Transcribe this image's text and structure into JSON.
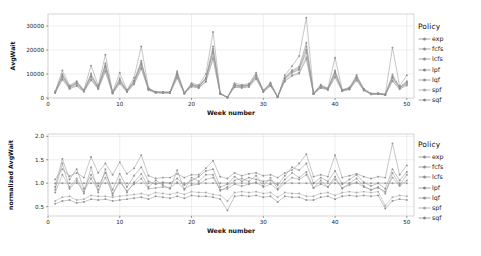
{
  "legend": {
    "title": "Policy",
    "items": [
      {
        "label": "exp",
        "color": "#8d8d8d"
      },
      {
        "label": "fcfs",
        "color": "#8f8f8f"
      },
      {
        "label": "lcfs",
        "color": "#909090"
      },
      {
        "label": "lpf",
        "color": "#8a8a8a"
      },
      {
        "label": "lqf",
        "color": "#939393"
      },
      {
        "label": "spf",
        "color": "#a6a6a6"
      },
      {
        "label": "sqf",
        "color": "#8b8b8b"
      }
    ]
  },
  "chart_data": [
    {
      "type": "line",
      "id": "avgwait",
      "title": "",
      "xlabel": "Week number",
      "ylabel": "AvgWait",
      "xlim": [
        0,
        51
      ],
      "ylim": [
        0,
        35000
      ],
      "xticks": [
        0,
        10,
        20,
        30,
        40,
        50
      ],
      "yticks": [
        0,
        10000,
        20000,
        30000
      ],
      "grid": true,
      "legend_position": "right",
      "x": [
        1,
        2,
        3,
        4,
        5,
        6,
        7,
        8,
        9,
        10,
        11,
        12,
        13,
        14,
        15,
        16,
        17,
        18,
        19,
        20,
        21,
        22,
        23,
        24,
        25,
        26,
        27,
        28,
        29,
        30,
        31,
        32,
        33,
        34,
        35,
        36,
        37,
        38,
        39,
        40,
        41,
        42,
        43,
        44,
        45,
        46,
        47,
        48,
        49,
        50
      ],
      "series": [
        {
          "name": "exp",
          "values": [
            2700,
            11500,
            5200,
            7000,
            3300,
            13500,
            5200,
            18000,
            2500,
            10500,
            3400,
            8500,
            21500,
            4200,
            2600,
            2500,
            2500,
            11200,
            2200,
            6200,
            5400,
            10000,
            27500,
            2000,
            300,
            6200,
            5500,
            6000,
            10500,
            3200,
            6500,
            500,
            9500,
            13200,
            17500,
            33500,
            2000,
            5500,
            4100,
            16800,
            3500,
            4400,
            9600,
            3900,
            1900,
            2000,
            1600,
            21000,
            5000,
            9500
          ]
        },
        {
          "name": "fcfs",
          "values": [
            2600,
            10000,
            4800,
            6600,
            3200,
            10200,
            4600,
            14500,
            2300,
            8200,
            3000,
            7300,
            15500,
            3900,
            2500,
            2400,
            2400,
            10500,
            2100,
            5800,
            5000,
            8500,
            21500,
            1900,
            280,
            5600,
            5100,
            5600,
            9700,
            3000,
            6000,
            480,
            8600,
            11600,
            13000,
            23000,
            1900,
            5100,
            3900,
            11500,
            3300,
            4100,
            8900,
            3700,
            1800,
            1900,
            1500,
            9800,
            4600,
            7000
          ]
        },
        {
          "name": "lcfs",
          "values": [
            2500,
            9500,
            4600,
            6300,
            3100,
            9500,
            4400,
            13800,
            2200,
            7600,
            2900,
            7000,
            14800,
            3800,
            2450,
            2350,
            2350,
            10000,
            2050,
            5600,
            4800,
            8200,
            20500,
            1850,
            270,
            5400,
            4900,
            5400,
            9400,
            2900,
            5800,
            470,
            8300,
            11200,
            12500,
            21500,
            1850,
            4900,
            3800,
            10900,
            3200,
            4000,
            8600,
            3600,
            1750,
            1850,
            1450,
            9000,
            4400,
            6600
          ]
        },
        {
          "name": "lpf",
          "values": [
            2450,
            9000,
            4500,
            6000,
            3000,
            9000,
            4300,
            13200,
            2150,
            7200,
            2850,
            6800,
            14200,
            3700,
            2400,
            2300,
            2300,
            9600,
            2000,
            5400,
            4700,
            7900,
            19500,
            1800,
            265,
            5200,
            4800,
            5300,
            9100,
            2850,
            5700,
            460,
            8000,
            10800,
            12000,
            20000,
            1800,
            4800,
            3750,
            10400,
            3150,
            3950,
            8400,
            3550,
            1720,
            1800,
            1420,
            8500,
            4300,
            6300
          ]
        },
        {
          "name": "lqf",
          "values": [
            2400,
            8700,
            4400,
            5800,
            2950,
            8600,
            4200,
            12800,
            2100,
            7000,
            2800,
            6600,
            13800,
            3650,
            2380,
            2280,
            2280,
            9300,
            1980,
            5300,
            4600,
            7700,
            18800,
            1780,
            260,
            5100,
            4700,
            5200,
            8900,
            2800,
            5600,
            450,
            7850,
            10500,
            11700,
            19000,
            1780,
            4700,
            3700,
            10000,
            3100,
            3900,
            8200,
            3500,
            1700,
            1780,
            1400,
            8200,
            4200,
            6100
          ]
        },
        {
          "name": "spf",
          "values": [
            2200,
            8000,
            4000,
            5200,
            2700,
            7800,
            3900,
            11600,
            1950,
            6300,
            2600,
            6000,
            12800,
            3400,
            2200,
            2100,
            2100,
            8600,
            1850,
            4900,
            4300,
            7000,
            17000,
            1650,
            240,
            4700,
            4400,
            4800,
            8200,
            2600,
            5200,
            420,
            7200,
            9600,
            10600,
            17000,
            1650,
            4300,
            3450,
            9000,
            2900,
            3650,
            7600,
            3250,
            1580,
            1650,
            1300,
            7300,
            3850,
            5500
          ]
        },
        {
          "name": "sqf",
          "values": [
            2100,
            7600,
            3800,
            5000,
            2600,
            7400,
            3750,
            11000,
            1880,
            6000,
            2500,
            5700,
            12200,
            3300,
            2150,
            2050,
            2050,
            8300,
            1800,
            4700,
            4150,
            6700,
            16200,
            1600,
            230,
            4500,
            4200,
            4600,
            7900,
            2500,
            5000,
            410,
            6900,
            9200,
            10200,
            16200,
            1600,
            4150,
            3350,
            8600,
            2800,
            3550,
            7300,
            3150,
            1520,
            1600,
            1250,
            7000,
            3700,
            5250
          ]
        }
      ]
    },
    {
      "type": "line",
      "id": "normalized-avgwait",
      "title": "",
      "xlabel": "Week number",
      "ylabel": "normalized AvgWait",
      "xlim": [
        0,
        51
      ],
      "ylim": [
        0.3,
        2.05
      ],
      "xticks": [
        0,
        10,
        20,
        30,
        40,
        50
      ],
      "yticks": [
        0.5,
        1.0,
        1.5,
        2.0
      ],
      "ytick_labels": [
        "0.5",
        "1.0",
        "1.5",
        "2.0"
      ],
      "grid": true,
      "legend_position": "right",
      "x": [
        1,
        2,
        3,
        4,
        5,
        6,
        7,
        8,
        9,
        10,
        11,
        12,
        13,
        14,
        15,
        16,
        17,
        18,
        19,
        20,
        21,
        22,
        23,
        24,
        25,
        26,
        27,
        28,
        29,
        30,
        31,
        32,
        33,
        34,
        35,
        36,
        37,
        38,
        39,
        40,
        41,
        42,
        43,
        44,
        45,
        46,
        47,
        48,
        49,
        50
      ],
      "series": [
        {
          "name": "exp",
          "values": [
            1.08,
            1.3,
            1.15,
            1.22,
            1.12,
            1.56,
            1.22,
            1.42,
            1.18,
            1.45,
            1.2,
            1.32,
            1.6,
            1.16,
            1.1,
            1.12,
            1.12,
            1.2,
            1.12,
            1.18,
            1.18,
            1.32,
            1.48,
            1.14,
            1.1,
            1.22,
            1.16,
            1.2,
            1.22,
            1.16,
            1.18,
            1.12,
            1.22,
            1.28,
            1.42,
            1.62,
            1.14,
            1.18,
            1.14,
            1.6,
            1.12,
            1.16,
            1.2,
            1.14,
            1.1,
            1.14,
            1.12,
            1.85,
            1.18,
            1.38
          ]
        },
        {
          "name": "fcfs",
          "values": [
            1.0,
            1.0,
            1.0,
            1.0,
            1.0,
            1.0,
            1.0,
            1.0,
            1.0,
            1.0,
            1.0,
            1.0,
            1.0,
            1.0,
            1.0,
            1.0,
            1.0,
            1.0,
            1.0,
            1.0,
            1.0,
            1.0,
            1.0,
            1.0,
            1.0,
            1.0,
            1.0,
            1.0,
            1.0,
            1.0,
            1.0,
            1.0,
            1.0,
            1.0,
            1.0,
            1.0,
            1.0,
            1.0,
            1.0,
            1.0,
            1.0,
            1.0,
            1.0,
            1.0,
            1.0,
            1.0,
            1.0,
            1.0,
            1.0,
            1.0
          ]
        },
        {
          "name": "lcfs",
          "values": [
            0.86,
            1.42,
            0.88,
            1.05,
            0.78,
            1.34,
            0.8,
            1.3,
            0.74,
            1.08,
            0.8,
            1.02,
            1.2,
            0.92,
            1.06,
            0.96,
            0.88,
            1.28,
            0.86,
            1.12,
            1.04,
            1.18,
            1.18,
            0.84,
            0.92,
            1.06,
            1.1,
            1.04,
            1.16,
            0.94,
            1.12,
            0.88,
            1.08,
            1.22,
            1.12,
            1.24,
            0.9,
            1.06,
            0.92,
            1.14,
            0.88,
            1.0,
            1.1,
            0.94,
            0.86,
            0.92,
            0.78,
            1.22,
            0.96,
            1.18
          ]
        },
        {
          "name": "lpf",
          "values": [
            0.92,
            1.52,
            1.08,
            1.3,
            0.88,
            1.18,
            0.94,
            1.22,
            0.86,
            1.2,
            0.92,
            1.16,
            1.34,
            1.04,
            0.98,
            1.02,
            1.0,
            1.1,
            0.96,
            1.06,
            1.14,
            1.26,
            1.3,
            0.92,
            0.98,
            1.14,
            1.04,
            1.12,
            1.08,
            1.04,
            1.06,
            0.96,
            1.16,
            1.34,
            1.28,
            1.42,
            1.0,
            1.12,
            1.04,
            1.26,
            0.98,
            1.08,
            1.18,
            1.02,
            0.94,
            1.0,
            0.88,
            1.3,
            1.06,
            1.24
          ]
        },
        {
          "name": "lqf",
          "values": [
            0.8,
            1.18,
            0.92,
            1.1,
            0.82,
            1.1,
            0.86,
            1.12,
            0.78,
            1.02,
            0.84,
            0.98,
            1.1,
            0.88,
            0.9,
            0.92,
            0.9,
            1.02,
            0.88,
            0.96,
            0.98,
            1.08,
            1.12,
            0.86,
            0.88,
            0.98,
            0.94,
            0.98,
            1.02,
            0.92,
            0.98,
            0.86,
            1.0,
            1.12,
            1.08,
            1.18,
            0.9,
            0.98,
            0.92,
            1.08,
            0.9,
            0.96,
            1.02,
            0.92,
            0.86,
            0.9,
            0.82,
            1.12,
            0.94,
            1.06
          ]
        },
        {
          "name": "spf",
          "values": [
            0.62,
            0.7,
            0.72,
            0.64,
            0.66,
            0.74,
            0.72,
            0.72,
            0.7,
            0.72,
            0.74,
            0.76,
            0.78,
            0.74,
            0.8,
            0.78,
            0.76,
            0.8,
            0.76,
            0.82,
            0.8,
            0.8,
            0.76,
            0.74,
            0.62,
            0.8,
            0.82,
            0.8,
            0.82,
            0.78,
            0.8,
            0.7,
            0.8,
            0.78,
            0.78,
            0.72,
            0.72,
            0.78,
            0.8,
            0.74,
            0.8,
            0.82,
            0.8,
            0.82,
            0.8,
            0.82,
            0.52,
            0.7,
            0.74,
            0.72
          ]
        },
        {
          "name": "sqf",
          "values": [
            0.56,
            0.62,
            0.64,
            0.58,
            0.6,
            0.66,
            0.64,
            0.66,
            0.62,
            0.64,
            0.66,
            0.68,
            0.7,
            0.66,
            0.72,
            0.7,
            0.68,
            0.72,
            0.68,
            0.74,
            0.72,
            0.72,
            0.7,
            0.66,
            0.42,
            0.72,
            0.74,
            0.72,
            0.74,
            0.7,
            0.72,
            0.6,
            0.72,
            0.7,
            0.7,
            0.64,
            0.64,
            0.7,
            0.72,
            0.66,
            0.72,
            0.74,
            0.72,
            0.74,
            0.72,
            0.74,
            0.46,
            0.62,
            0.66,
            0.64
          ]
        }
      ]
    }
  ]
}
